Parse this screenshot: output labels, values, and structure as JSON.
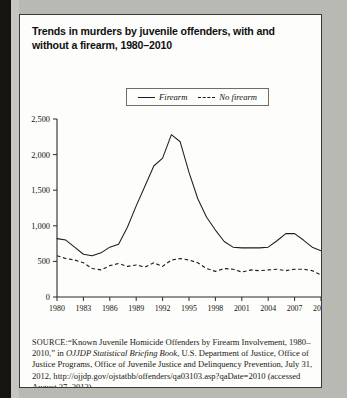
{
  "figure": {
    "title": "Trends in murders by juvenile offenders, with and without a firearm, 1980–2010"
  },
  "legend": {
    "position": "top-center",
    "entries": [
      {
        "label": "Firearm",
        "style": "solid"
      },
      {
        "label": "No firearm",
        "style": "dashed"
      }
    ]
  },
  "source": {
    "kicker": "SOURCE:",
    "line1": "“Known Juvenile Homicide Offenders by Firearm Involvement, 1980–2010,” in ",
    "italic_title": "OJJDP Statistical Briefing Book",
    "line2": ", U.S. Department of Justice, Office of Justice Programs, Office of Juvenile Justice and Delinquency Prevention, July 31, 2012, http://ojjdp.gov/ojstatbb/offenders/qa03103.asp?qaDate=2010 (accessed August 27, 2012)"
  },
  "chart_data": {
    "type": "line",
    "title": "Trends in murders by juvenile offenders, with and without a firearm, 1980–2010",
    "xlabel": "",
    "ylabel": "",
    "xlim": [
      1980,
      2010
    ],
    "ylim": [
      0,
      2500
    ],
    "grid": false,
    "legend_position": "top-center",
    "ytick_labels": [
      "0",
      "500",
      "1,000",
      "1,500",
      "2,000",
      "2,500"
    ],
    "ytick_values": [
      0,
      500,
      1000,
      1500,
      2000,
      2500
    ],
    "xtick_labels": [
      "1980",
      "1983",
      "1986",
      "1989",
      "1992",
      "1995",
      "1998",
      "2001",
      "2004",
      "2007",
      "2010"
    ],
    "xtick_values": [
      1980,
      1983,
      1986,
      1989,
      1992,
      1995,
      1998,
      2001,
      2004,
      2007,
      2010
    ],
    "x": [
      1980,
      1981,
      1982,
      1983,
      1984,
      1985,
      1986,
      1987,
      1988,
      1989,
      1990,
      1991,
      1992,
      1993,
      1994,
      1995,
      1996,
      1997,
      1998,
      1999,
      2000,
      2001,
      2002,
      2003,
      2004,
      2005,
      2006,
      2007,
      2008,
      2009,
      2010
    ],
    "series": [
      {
        "name": "Firearm",
        "style": "solid",
        "values": [
          820,
          800,
          700,
          600,
          580,
          620,
          700,
          740,
          980,
          1280,
          1560,
          1840,
          1950,
          2280,
          2180,
          1750,
          1380,
          1120,
          940,
          780,
          700,
          690,
          690,
          690,
          700,
          790,
          890,
          890,
          800,
          700,
          650
        ]
      },
      {
        "name": "No firearm",
        "style": "dashed",
        "values": [
          580,
          540,
          520,
          480,
          400,
          380,
          440,
          470,
          430,
          450,
          420,
          480,
          430,
          520,
          540,
          520,
          480,
          400,
          360,
          400,
          390,
          350,
          380,
          370,
          380,
          390,
          370,
          390,
          390,
          370,
          310
        ]
      }
    ]
  }
}
